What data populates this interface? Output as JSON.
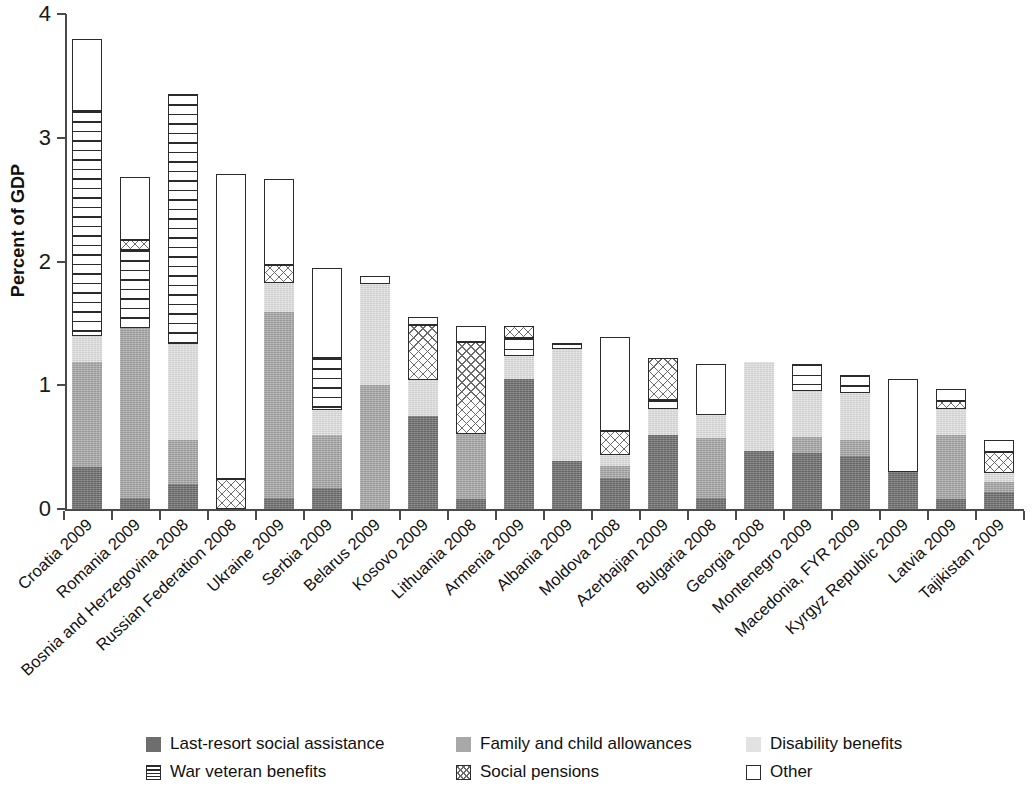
{
  "chart_data": {
    "type": "bar",
    "stacked": true,
    "title": "",
    "xlabel": "",
    "ylabel": "Percent of GDP",
    "ylim": [
      0,
      4
    ],
    "yticks": [
      0,
      1,
      2,
      3,
      4
    ],
    "ytick_labels": [
      "0",
      "1",
      "2",
      "3",
      "4"
    ],
    "grid": false,
    "legend_position": "bottom",
    "categories": [
      "Croatia 2009",
      "Romania 2009",
      "Bosnia and Herzegovina 2008",
      "Russian Federation 2008",
      "Ukraine 2009",
      "Serbia 2009",
      "Belarus 2009",
      "Kosovo 2009",
      "Lithuania 2008",
      "Armenia 2009",
      "Albania 2009",
      "Moldova 2008",
      "Azerbaijan 2009",
      "Bulgaria 2008",
      "Georgia 2008",
      "Montenegro 2009",
      "Macedonia, FYR 2009",
      "Kyrgyz Republic 2009",
      "Latvia 2009",
      "Tajikistan 2009"
    ],
    "series": [
      {
        "name": "Last-resort social assistance",
        "color": "#6e6e6e",
        "pattern": "solid-dark",
        "values": [
          0.34,
          0.09,
          0.2,
          0.0,
          0.09,
          0.17,
          0.0,
          0.75,
          0.08,
          1.05,
          0.39,
          0.25,
          0.6,
          0.09,
          0.47,
          0.45,
          0.43,
          0.3,
          0.08,
          0.14
        ]
      },
      {
        "name": "Family and child allowances",
        "color": "#a8a8a8",
        "pattern": "solid-medium",
        "values": [
          0.85,
          1.37,
          0.36,
          0.0,
          1.5,
          0.43,
          1.0,
          0.0,
          0.53,
          0.0,
          0.0,
          0.1,
          0.0,
          0.48,
          0.0,
          0.13,
          0.13,
          0.0,
          0.52,
          0.08
        ]
      },
      {
        "name": "Disability benefits",
        "color": "#e2e2e2",
        "pattern": "solid-light",
        "values": [
          0.21,
          0.0,
          0.77,
          0.0,
          0.24,
          0.2,
          0.82,
          0.29,
          0.0,
          0.19,
          0.9,
          0.09,
          0.21,
          0.19,
          0.72,
          0.37,
          0.38,
          0.0,
          0.21,
          0.07
        ]
      },
      {
        "name": "War veteran benefits",
        "color": "#ffffff",
        "pattern": "horizontal-lines",
        "values": [
          1.82,
          0.63,
          2.02,
          0.0,
          0.0,
          0.42,
          0.0,
          0.0,
          0.0,
          0.14,
          0.05,
          0.0,
          0.07,
          0.0,
          0.0,
          0.22,
          0.14,
          0.0,
          0.0,
          0.0
        ]
      },
      {
        "name": "Social pensions",
        "color": "#ffffff",
        "pattern": "crosshatch",
        "values": [
          0.0,
          0.08,
          0.0,
          0.24,
          0.14,
          0.0,
          0.0,
          0.45,
          0.74,
          0.1,
          0.0,
          0.19,
          0.34,
          0.0,
          0.0,
          0.0,
          0.0,
          0.0,
          0.06,
          0.17
        ]
      },
      {
        "name": "Other",
        "color": "#ffffff",
        "pattern": "open",
        "values": [
          0.58,
          0.51,
          0.0,
          2.47,
          0.7,
          0.73,
          0.06,
          0.06,
          0.13,
          0.0,
          0.0,
          0.76,
          0.0,
          0.41,
          0.0,
          0.0,
          0.0,
          0.75,
          0.1,
          0.1
        ]
      }
    ],
    "totals": [
      3.8,
      3.38,
      3.35,
      2.71,
      2.67,
      1.95,
      1.88,
      1.55,
      1.48,
      1.48,
      1.34,
      1.39,
      1.22,
      1.17,
      1.19,
      1.17,
      1.08,
      1.05,
      0.97,
      0.56
    ]
  },
  "axis": {
    "y_label": "Percent of GDP",
    "y_ticks": [
      "0",
      "1",
      "2",
      "3",
      "4"
    ]
  },
  "legend": {
    "row1": [
      {
        "label": "Last-resort social assistance",
        "key": "lastresort"
      },
      {
        "label": "Family and child allowances",
        "key": "family"
      },
      {
        "label": "Disability benefits",
        "key": "disability"
      }
    ],
    "row2": [
      {
        "label": "War veteran benefits",
        "key": "warveteran"
      },
      {
        "label": "Social pensions",
        "key": "socialpension"
      },
      {
        "label": "Other",
        "key": "other"
      }
    ]
  }
}
